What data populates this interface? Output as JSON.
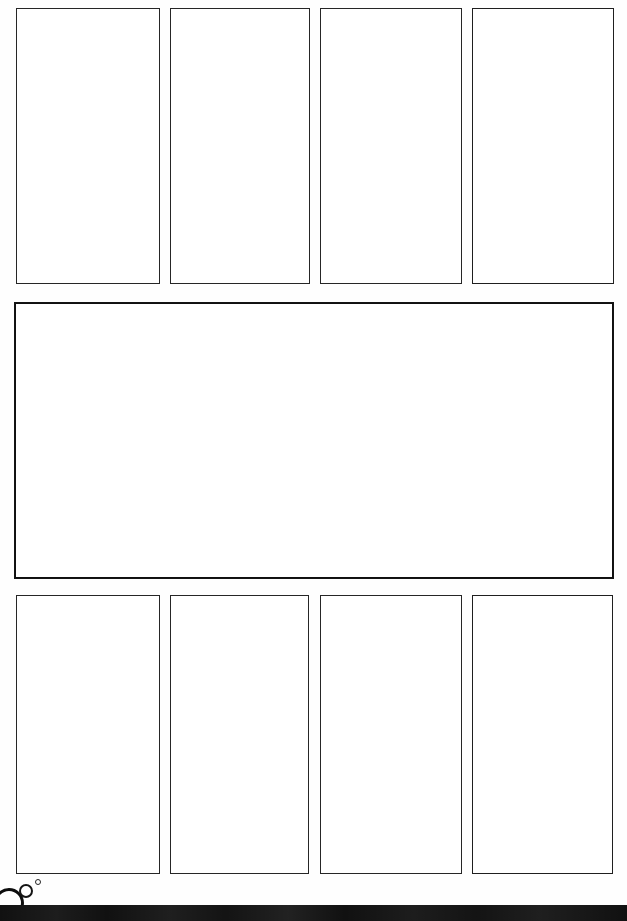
{
  "page": {
    "width": 627,
    "height": 921,
    "background_color": "#ffffff",
    "ink_color": "#2e2e2e"
  },
  "top_row": {
    "label": "top-panel-row",
    "panels": [
      {
        "name": "top-panel-1",
        "label": "",
        "x": 16,
        "y": 8,
        "width": 144,
        "height": 276,
        "stroke": "thin"
      },
      {
        "name": "top-panel-2",
        "label": "",
        "x": 170,
        "y": 8,
        "width": 140,
        "height": 276,
        "stroke": "thin"
      },
      {
        "name": "top-panel-3",
        "label": "",
        "x": 320,
        "y": 8,
        "width": 142,
        "height": 276,
        "stroke": "thin"
      },
      {
        "name": "top-panel-4",
        "label": "",
        "x": 472,
        "y": 8,
        "width": 142,
        "height": 276,
        "stroke": "medium"
      }
    ]
  },
  "middle_row": {
    "label": "middle-panel-row",
    "panels": [
      {
        "name": "middle-panel-wide",
        "label": "",
        "x": 14,
        "y": 302,
        "width": 600,
        "height": 277,
        "stroke": "thick"
      }
    ]
  },
  "bottom_row": {
    "label": "bottom-panel-row",
    "panels": [
      {
        "name": "bottom-panel-1",
        "label": "",
        "x": 16,
        "y": 595,
        "width": 144,
        "height": 279,
        "stroke": "thin"
      },
      {
        "name": "bottom-panel-2",
        "label": "",
        "x": 170,
        "y": 595,
        "width": 139,
        "height": 279,
        "stroke": "thin"
      },
      {
        "name": "bottom-panel-3",
        "label": "",
        "x": 320,
        "y": 595,
        "width": 142,
        "height": 279,
        "stroke": "thin"
      },
      {
        "name": "bottom-panel-4",
        "label": "",
        "x": 472,
        "y": 595,
        "width": 141,
        "height": 279,
        "stroke": "medium"
      }
    ]
  },
  "decorations": {
    "label": "bubble-marks",
    "bubbles": [
      {
        "name": "bubble-large",
        "cx": 9,
        "cy": 903,
        "r": 15,
        "stroke_width": 3,
        "color": "#0d0d0d"
      },
      {
        "name": "bubble-medium",
        "cx": 26,
        "cy": 891,
        "r": 7,
        "stroke_width": 2,
        "color": "#141414"
      },
      {
        "name": "bubble-small",
        "cx": 38,
        "cy": 882,
        "r": 3,
        "stroke_width": 1.2,
        "color": "#262626"
      }
    ]
  },
  "footer": {
    "name": "black-footer-bar",
    "label": "",
    "y": 905,
    "height": 16,
    "color": "#111111"
  }
}
